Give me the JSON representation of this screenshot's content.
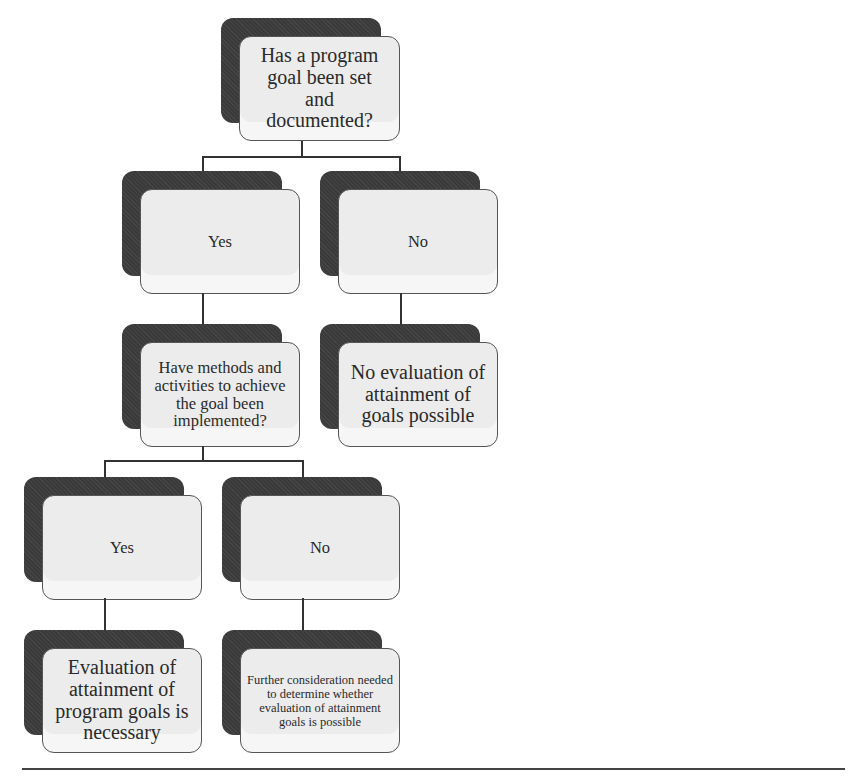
{
  "diagram": {
    "type": "decision-tree",
    "nodes": {
      "root": {
        "label": "Has a program goal been set and documented?"
      },
      "l1_yes": {
        "label": "Yes"
      },
      "l1_no": {
        "label": "No"
      },
      "l2_methods": {
        "label": "Have methods and activities to achieve the goal been implemented?"
      },
      "l2_no_eval": {
        "label": "No evaluation of attainment of goals possible"
      },
      "l3_yes": {
        "label": "Yes"
      },
      "l3_no": {
        "label": "No"
      },
      "l4_necessary": {
        "label": "Evaluation of attainment of program goals is necessary"
      },
      "l4_further": {
        "label": "Further consideration needed to determine whether evaluation of attainment goals is possible"
      }
    },
    "edges": [
      [
        "root",
        "l1_yes"
      ],
      [
        "root",
        "l1_no"
      ],
      [
        "l1_yes",
        "l2_methods"
      ],
      [
        "l1_no",
        "l2_no_eval"
      ],
      [
        "l2_methods",
        "l3_yes"
      ],
      [
        "l2_methods",
        "l3_no"
      ],
      [
        "l3_yes",
        "l4_necessary"
      ],
      [
        "l3_no",
        "l4_further"
      ]
    ]
  }
}
